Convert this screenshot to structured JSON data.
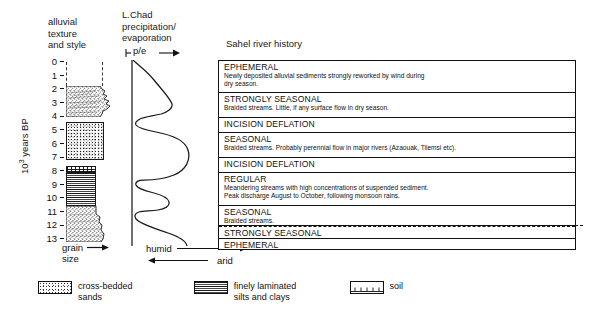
{
  "figure": {
    "columns": {
      "lithology_header": "alluvial\ntexture\nand style",
      "lithology_header_lines": [
        "alluvial",
        "texture",
        "and style"
      ],
      "precipitation_header_lines": [
        "L.Chad",
        "precipitation/",
        "evaporation"
      ],
      "pe_axis_label": "p/e",
      "sahel_header": "Sahel river history"
    },
    "yaxis": {
      "label_prefix": "10",
      "label_exponent": "3",
      "label_suffix": " years BP",
      "ticks": [
        "0",
        "1",
        "2",
        "3",
        "4",
        "5",
        "6",
        "7",
        "8",
        "9",
        "10",
        "11",
        "12",
        "13"
      ],
      "min": 0,
      "max": 13
    },
    "grain_axis": {
      "line1": "grain",
      "line2": "size",
      "arrow": "right"
    },
    "climate_axis": {
      "humid": "humid",
      "arid": "arid"
    },
    "legend": [
      {
        "pattern": "cross-bedded-sands",
        "line1": "cross-bedded",
        "line2": "sands"
      },
      {
        "pattern": "finely-laminated-silts-clays",
        "line1": "finely laminated",
        "line2": "silts and clays"
      },
      {
        "pattern": "soil",
        "line1": "soil",
        "line2": ""
      }
    ]
  },
  "sahel_rows": [
    {
      "title": "EPHEMERAL",
      "desc": [
        "Newly deposited alluvial sediments strongly reworked by wind during",
        "dry season."
      ],
      "height": 32,
      "dashed_top": false
    },
    {
      "title": "STRONGLY SEASONAL",
      "desc": [
        "Braided streams. Little, if any surface flow in dry season."
      ],
      "height": 25,
      "dashed_top": false
    },
    {
      "title": "INCISION DEFLATION",
      "desc": [],
      "height": 15,
      "dashed_top": false
    },
    {
      "title": "SEASONAL",
      "desc": [
        "Braided streams. Probably perennial flow in major rivers (Azaouak, Tilemsi etc)."
      ],
      "height": 25,
      "dashed_top": false
    },
    {
      "title": "INCISION DEFLATION",
      "desc": [],
      "height": 15,
      "dashed_top": false
    },
    {
      "title": "REGULAR",
      "desc": [
        "Meandering streams with high concentrations of suspended sediment.",
        "Peak discharge August to October,  following monsoon rains."
      ],
      "height": 33,
      "dashed_top": false
    },
    {
      "title": "SEASONAL",
      "desc": [
        "Braided streams."
      ],
      "height": 20,
      "dashed_top": false
    },
    {
      "title": "STRONGLY SEASONAL",
      "desc": [],
      "height": 13,
      "dashed_top": true
    },
    {
      "title": "EPHEMERAL",
      "desc": [],
      "height": 12,
      "dashed_top": false
    }
  ],
  "chart_data": {
    "type": "line",
    "xlabel": "p/e",
    "ylabel": "10^3 years BP",
    "ylim": [
      0,
      13
    ],
    "y_inverted": true,
    "grid": false,
    "legend_position": "bottom-left",
    "series": [
      {
        "name": "L.Chad p/e",
        "x": [
          0.02,
          0.05,
          0.12,
          0.3,
          0.52,
          0.62,
          0.55,
          0.38,
          0.22,
          0.14,
          0.2,
          0.4,
          0.72,
          0.88,
          0.92,
          0.88,
          0.7,
          0.42,
          0.2,
          0.1,
          0.14,
          0.3,
          0.48,
          0.55,
          0.5,
          0.34,
          0.18,
          0.1,
          0.14,
          0.32,
          0.62,
          0.82,
          0.9,
          0.86,
          0.66,
          0.4,
          0.2,
          0.1,
          0.06,
          0.16,
          0.34,
          0.42,
          0.38,
          0.24,
          0.12,
          0.06,
          0.05,
          0.1,
          0.24,
          0.44,
          0.56,
          0.52,
          0.34,
          0.16,
          0.06,
          0.02,
          0.01
        ],
        "y": [
          0.0,
          0.4,
          0.9,
          1.5,
          2.1,
          2.6,
          3.0,
          3.3,
          3.6,
          3.85,
          4.05,
          4.2,
          4.4,
          4.7,
          5.1,
          5.5,
          5.9,
          6.2,
          6.5,
          6.75,
          6.95,
          7.1,
          7.3,
          7.55,
          7.8,
          8.0,
          8.2,
          8.4,
          8.55,
          8.7,
          8.9,
          9.2,
          9.6,
          10.0,
          10.35,
          10.6,
          10.85,
          11.05,
          11.2,
          11.35,
          11.55,
          11.8,
          12.0,
          12.2,
          12.4,
          12.55,
          12.7,
          12.8,
          12.9,
          13.0,
          13.0,
          13.0,
          13.0,
          13.0,
          13.0,
          13.0,
          13.0
        ],
        "note": "higher p/e to the right = humid; lower = arid"
      }
    ],
    "lithology_units": [
      {
        "label": "cross-bedded sands",
        "pattern": "sand",
        "top_ka": 1.9,
        "base_ka": 4.1,
        "relative_grain_width": 0.85,
        "shape": "lensy-jagged-right-edge"
      },
      {
        "label": "cross-bedded sands",
        "pattern": "sand-coarse",
        "top_ka": 4.5,
        "base_ka": 7.2,
        "relative_grain_width": 0.8,
        "shape": "rectangular"
      },
      {
        "label": "soil",
        "pattern": "soil",
        "top_ka": 7.8,
        "base_ka": 8.1,
        "relative_grain_width": 0.62,
        "shape": "thin-band"
      },
      {
        "label": "finely laminated silts and clays",
        "pattern": "laminated",
        "top_ka": 8.1,
        "base_ka": 10.5,
        "relative_grain_width": 0.62,
        "shape": "rectangular"
      },
      {
        "label": "cross-bedded sands",
        "pattern": "sand",
        "top_ka": 10.5,
        "base_ka": 13.0,
        "relative_grain_width": 0.95,
        "shape": "widening-downward"
      }
    ],
    "dashed_markers_ka": [
      0.0,
      1.9
    ],
    "annotations": [
      "grain size increases to the right",
      "humid to the right, arid to the left"
    ]
  },
  "colors": {
    "ink": "#111111",
    "background": "#ffffff",
    "pattern_dark": "#1b1b1b"
  }
}
